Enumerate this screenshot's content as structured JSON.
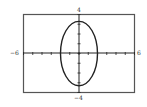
{
  "chart_data": {
    "type": "line",
    "title": "",
    "equation_estimate": "x^2/4 + y^2/11 = 1",
    "series": [
      {
        "name": "ellipse",
        "semi_axis_x": 2,
        "semi_axis_y": 3.3,
        "center": [
          0,
          0
        ]
      }
    ],
    "xlim": [
      -6,
      6
    ],
    "ylim": [
      -4,
      4
    ],
    "xlabel": "",
    "ylabel": "",
    "x_tick_step": 1,
    "y_tick_step": 1,
    "grid": false,
    "legend": null,
    "axis_labels": {
      "xmin": "−6",
      "xmax": "6",
      "ymin": "−4",
      "ymax": "4"
    },
    "colors": {
      "frame": "#555555",
      "curve": "#222222",
      "axes": "#222222"
    }
  }
}
